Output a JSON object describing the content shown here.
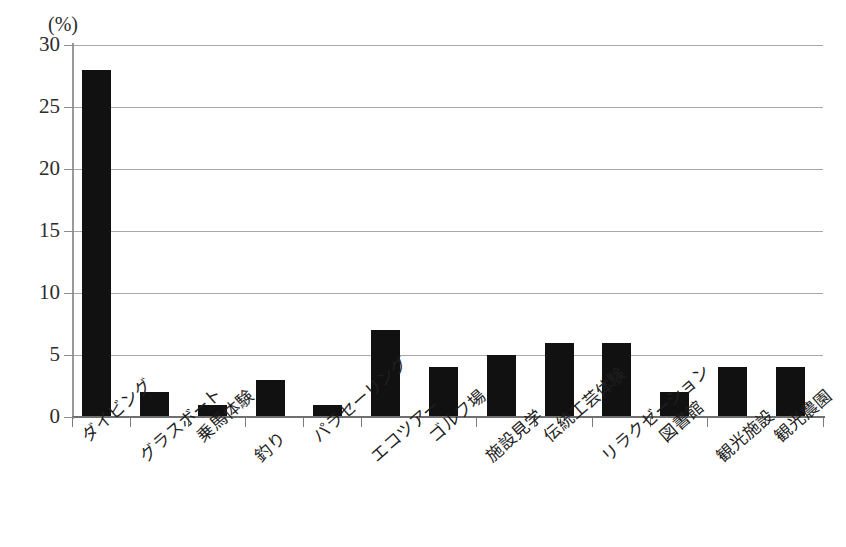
{
  "chart_data": {
    "type": "bar",
    "title": "",
    "subtitle": "",
    "xlabel": "",
    "ylabel": "",
    "unit_label": "(%)",
    "ylim": [
      0,
      30
    ],
    "ytick_step": 5,
    "yticks": [
      0,
      5,
      10,
      15,
      20,
      25,
      30
    ],
    "ytick_labels": [
      "0",
      "5",
      "10",
      "15",
      "20",
      "25",
      "30"
    ],
    "grid": true,
    "grid_axis": "y",
    "legend": false,
    "legend_position": "none",
    "bar_color": "#111111",
    "gridline_color": "#a8a8a8",
    "axis_color": "#6f6f6f",
    "label_rotation_deg": -41,
    "categories": [
      "ダイビング",
      "グラスボート",
      "乗馬体験",
      "釣り",
      "パラセーリング",
      "エコツアー",
      "ゴルフ場",
      "施設見学",
      "伝統工芸体験",
      "リラクゼーション",
      "図書館",
      "観光施設",
      "観光農園"
    ],
    "values": [
      28,
      2,
      1,
      3,
      1,
      7,
      4,
      5,
      6,
      6,
      2,
      4,
      4
    ],
    "annotations": []
  }
}
